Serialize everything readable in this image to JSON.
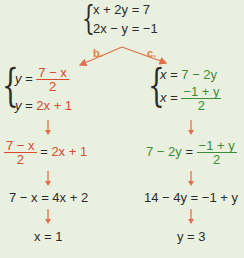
{
  "system": {
    "eq1": "x + 2y = 7",
    "eq2": "2x − y = −1"
  },
  "branches": {
    "b_label": "b.",
    "c_label": "c."
  },
  "left": {
    "sys1_lhs": "y = ",
    "sys1_num": "7 − x",
    "sys1_den": "2",
    "sys2_lhs": "y = ",
    "sys2_rhs": "2x + 1",
    "step1_num": "7 − x",
    "step1_den": "2",
    "step1_mid": " = ",
    "step1_rhs": "2x + 1",
    "step2": "7 − x = 4x + 2",
    "result": "x = 1"
  },
  "right": {
    "sys1_lhs": "x = ",
    "sys1_rhs": "7 − 2y",
    "sys2_lhs": "x = ",
    "sys2_num": "−1 + y",
    "sys2_den": "2",
    "step1_lhs": "7 − 2y",
    "step1_mid": " = ",
    "step1_num": "−1 + y",
    "step1_den": "2",
    "step2": "14 − 4y = −1 + y",
    "result": "y = 3"
  },
  "colors": {
    "red": "#d84a2c",
    "green": "#3d8c3a",
    "arrow": "#e0704a",
    "background": "#eaf0df"
  }
}
